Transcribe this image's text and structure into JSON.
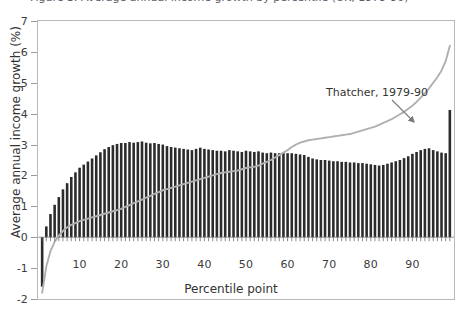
{
  "title": {
    "text": "Figure 3. Average annual income growth by percentile (UK, 1979-90)",
    "visible_fragment": "clipped"
  },
  "axes": {
    "y": {
      "label": "Average annual income growth (%)",
      "ticks": [
        7,
        6,
        5,
        4,
        3,
        2,
        1,
        0,
        -1,
        -2
      ],
      "tick_labels": [
        "7",
        "6",
        "5",
        "4",
        "3",
        "2",
        "1",
        "0",
        "-1",
        "-2"
      ],
      "min": -2,
      "max": 7
    },
    "x": {
      "label": "Percentile point",
      "ticks": [
        10,
        20,
        30,
        40,
        50,
        60,
        70,
        80,
        90
      ],
      "tick_labels": [
        "10",
        "20",
        "30",
        "40",
        "50",
        "60",
        "70",
        "80",
        "90"
      ],
      "min": 0,
      "max": 100
    }
  },
  "annotations": [
    {
      "name": "thatcher-annotation",
      "text": "Thatcher, 1979-90",
      "target_percentile": 78
    }
  ],
  "colors": {
    "bar": "#2b2b2b",
    "line": "#b0b0b0",
    "frame": "#b9b9b9",
    "text": "#3c3c3c",
    "background": "#ffffff"
  },
  "chart_data": {
    "type": "bar",
    "xlabel": "Percentile point",
    "ylabel": "Average annual income growth (%)",
    "ylim": [
      -2,
      7
    ],
    "xlim": [
      0,
      100
    ],
    "grid": false,
    "legend": "none",
    "categories": [
      1,
      2,
      3,
      4,
      5,
      6,
      7,
      8,
      9,
      10,
      11,
      12,
      13,
      14,
      15,
      16,
      17,
      18,
      19,
      20,
      21,
      22,
      23,
      24,
      25,
      26,
      27,
      28,
      29,
      30,
      31,
      32,
      33,
      34,
      35,
      36,
      37,
      38,
      39,
      40,
      41,
      42,
      43,
      44,
      45,
      46,
      47,
      48,
      49,
      50,
      51,
      52,
      53,
      54,
      55,
      56,
      57,
      58,
      59,
      60,
      61,
      62,
      63,
      64,
      65,
      66,
      67,
      68,
      69,
      70,
      71,
      72,
      73,
      74,
      75,
      76,
      77,
      78,
      79,
      80,
      81,
      82,
      83,
      84,
      85,
      86,
      87,
      88,
      89,
      90,
      91,
      92,
      93,
      94,
      95,
      96,
      97,
      98,
      99
    ],
    "series": [
      {
        "name": "Average annual income growth (%)",
        "type": "bar",
        "color": "#2b2b2b",
        "values": [
          -1.6,
          0.35,
          0.75,
          1.05,
          1.3,
          1.55,
          1.75,
          1.95,
          2.1,
          2.25,
          2.35,
          2.45,
          2.55,
          2.65,
          2.75,
          2.85,
          2.92,
          2.98,
          3.02,
          3.05,
          3.05,
          3.08,
          3.06,
          3.08,
          3.1,
          3.06,
          3.04,
          3.05,
          3.02,
          3.0,
          2.95,
          2.92,
          2.9,
          2.88,
          2.86,
          2.84,
          2.82,
          2.86,
          2.9,
          2.86,
          2.84,
          2.82,
          2.8,
          2.8,
          2.78,
          2.82,
          2.8,
          2.78,
          2.76,
          2.8,
          2.78,
          2.76,
          2.78,
          2.74,
          2.72,
          2.74,
          2.72,
          2.72,
          2.74,
          2.72,
          2.72,
          2.7,
          2.68,
          2.66,
          2.6,
          2.55,
          2.52,
          2.5,
          2.5,
          2.48,
          2.46,
          2.46,
          2.44,
          2.44,
          2.42,
          2.42,
          2.4,
          2.4,
          2.38,
          2.36,
          2.34,
          2.32,
          2.34,
          2.38,
          2.42,
          2.46,
          2.5,
          2.56,
          2.62,
          2.7,
          2.76,
          2.82,
          2.86,
          2.88,
          2.82,
          2.78,
          2.74,
          2.72,
          4.12
        ]
      },
      {
        "name": "Thatcher, 1979-90 (cumulative line)",
        "type": "line",
        "color": "#b0b0b0",
        "values": [
          -1.8,
          -0.95,
          -0.45,
          -0.15,
          0.05,
          0.2,
          0.32,
          0.4,
          0.46,
          0.52,
          0.56,
          0.6,
          0.64,
          0.68,
          0.72,
          0.76,
          0.8,
          0.84,
          0.88,
          0.92,
          0.98,
          1.04,
          1.1,
          1.16,
          1.22,
          1.28,
          1.34,
          1.4,
          1.46,
          1.52,
          1.56,
          1.6,
          1.64,
          1.68,
          1.72,
          1.76,
          1.8,
          1.84,
          1.88,
          1.92,
          1.96,
          2.0,
          2.04,
          2.08,
          2.1,
          2.12,
          2.14,
          2.16,
          2.2,
          2.24,
          2.26,
          2.28,
          2.32,
          2.38,
          2.44,
          2.5,
          2.58,
          2.66,
          2.74,
          2.82,
          2.92,
          3.0,
          3.06,
          3.1,
          3.14,
          3.16,
          3.18,
          3.2,
          3.22,
          3.24,
          3.26,
          3.28,
          3.3,
          3.32,
          3.34,
          3.38,
          3.42,
          3.46,
          3.5,
          3.54,
          3.58,
          3.64,
          3.7,
          3.76,
          3.82,
          3.9,
          3.98,
          4.06,
          4.16,
          4.26,
          4.38,
          4.52,
          4.66,
          4.82,
          5.0,
          5.18,
          5.4,
          5.7,
          6.2
        ]
      }
    ]
  }
}
